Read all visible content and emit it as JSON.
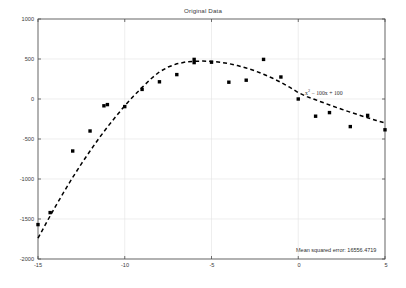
{
  "chart_data": {
    "type": "scatter",
    "title": "Original Data",
    "xlabel": "",
    "ylabel": "",
    "xlim": [
      -15,
      5
    ],
    "ylim": [
      -2000,
      1000
    ],
    "xticks": [
      -15,
      -10,
      -5,
      0,
      5
    ],
    "yticks": [
      1000,
      500,
      0,
      -500,
      -1000,
      -1500,
      -2000
    ],
    "xtick_labels": [
      "-15",
      "-10",
      "-5",
      "0",
      "5"
    ],
    "ytick_labels": [
      "1000",
      "500",
      "0",
      "-500",
      "-1000",
      "-1500",
      "-2000"
    ],
    "grid": true,
    "legend": "none",
    "series": [
      {
        "name": "Original Data",
        "type": "scatter",
        "marker": "square",
        "color": "#000000",
        "points": [
          {
            "x": -15.0,
            "y": -1570
          },
          {
            "x": -14.3,
            "y": -1420
          },
          {
            "x": -13.0,
            "y": -650
          },
          {
            "x": -12.0,
            "y": -400
          },
          {
            "x": -11.2,
            "y": -85
          },
          {
            "x": -11.0,
            "y": -70
          },
          {
            "x": -10.0,
            "y": -95
          },
          {
            "x": -9.0,
            "y": 120
          },
          {
            "x": -8.0,
            "y": 215
          },
          {
            "x": -7.0,
            "y": 305
          },
          {
            "x": -6.0,
            "y": 495
          },
          {
            "x": -6.0,
            "y": 455
          },
          {
            "x": -5.0,
            "y": 460
          },
          {
            "x": -4.0,
            "y": 210
          },
          {
            "x": -3.0,
            "y": 235
          },
          {
            "x": -2.0,
            "y": 495
          },
          {
            "x": -1.0,
            "y": 275
          },
          {
            "x": 0.0,
            "y": 0
          },
          {
            "x": 1.0,
            "y": -215
          },
          {
            "x": 1.8,
            "y": -170
          },
          {
            "x": 3.0,
            "y": -345
          },
          {
            "x": 4.0,
            "y": -205
          },
          {
            "x": 5.0,
            "y": -385
          }
        ]
      },
      {
        "name": "Fitted curve",
        "type": "line",
        "style": "dashed",
        "color": "#000000",
        "equation": "x^2 - 100x + 100",
        "coefficients": {
          "a": -20.5,
          "b": -215,
          "c": 460,
          "vertex_x": -5.2,
          "vertex_y": 465
        },
        "x": [
          -15.0,
          -14.5,
          -14.0,
          -13.5,
          -13.0,
          -12.5,
          -12.0,
          -11.5,
          -11.0,
          -10.5,
          -10.0,
          -9.5,
          -9.0,
          -8.5,
          -8.0,
          -7.5,
          -7.0,
          -6.5,
          -6.0,
          -5.5,
          -5.0,
          -4.5,
          -4.0,
          -3.5,
          -3.0,
          -2.5,
          -2.0,
          -1.5,
          -1.0,
          -0.5,
          0.0,
          0.5,
          1.0,
          1.5,
          2.0,
          2.5,
          3.0,
          3.5,
          4.0,
          4.5,
          5.0
        ],
        "y": [
          -1740,
          -1540,
          -1345,
          -1160,
          -980,
          -810,
          -650,
          -495,
          -350,
          -215,
          -85,
          35,
          145,
          250,
          340,
          400,
          440,
          462,
          472,
          474,
          470,
          460,
          442,
          418,
          388,
          352,
          310,
          262,
          208,
          148,
          80,
          30,
          -10,
          -50,
          -90,
          -128,
          -165,
          -200,
          -235,
          -268,
          -300
        ]
      }
    ],
    "annotations": [
      {
        "name": "equation-label",
        "text_pre": "x",
        "text_sup": "2",
        "text_post": " − 100x + 100",
        "x_px": 305,
        "y_px": 88
      },
      {
        "name": "mse-label",
        "text": "Mean squared error: 16556.4719",
        "x_px": 296,
        "y_px": 247
      }
    ]
  },
  "figure": {
    "title": "Original Data",
    "background_color": "#ffffff",
    "axes_color": "#4d4d4d",
    "grid_color": "#e2e2e2",
    "marker_color": "#000000"
  },
  "axis": {
    "x_labels": [
      "-15",
      "-10",
      "-5",
      "0",
      "5"
    ],
    "y_labels": [
      "1000",
      "500",
      "0",
      "-500",
      "-1000",
      "-1500",
      "-2000"
    ]
  },
  "annotations": {
    "equation_pre": "x",
    "equation_sup": "2",
    "equation_post": " − 100x + 100",
    "mse": "Mean squared error: 16556.4719"
  }
}
